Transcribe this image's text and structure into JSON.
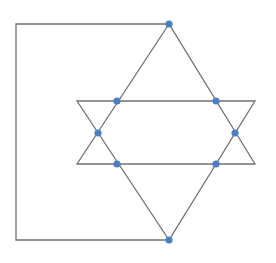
{
  "diagram": {
    "width": 276,
    "height": 263,
    "colors": {
      "line": "#707070",
      "node": "#4a7fc1",
      "background": "#ffffff"
    },
    "line_width": 1.3,
    "node_radius": 3.6,
    "bracket": {
      "points": [
        [
          169,
          24
        ],
        [
          16,
          24
        ],
        [
          16,
          240
        ],
        [
          169,
          240
        ]
      ]
    },
    "triangles": [
      {
        "name": "up-triangle",
        "points": [
          [
            169,
            24
          ],
          [
            77,
            164
          ],
          [
            255,
            164
          ]
        ]
      },
      {
        "name": "down-triangle",
        "points": [
          [
            169,
            240
          ],
          [
            77,
            101
          ],
          [
            255,
            101
          ]
        ]
      }
    ],
    "nodes": [
      {
        "name": "top-apex",
        "x": 169,
        "y": 24
      },
      {
        "name": "upper-left",
        "x": 117,
        "y": 101
      },
      {
        "name": "upper-right",
        "x": 216,
        "y": 101
      },
      {
        "name": "middle-left",
        "x": 98,
        "y": 133
      },
      {
        "name": "middle-right",
        "x": 235,
        "y": 133
      },
      {
        "name": "lower-left",
        "x": 117,
        "y": 164
      },
      {
        "name": "lower-right",
        "x": 216,
        "y": 164
      },
      {
        "name": "bottom-apex",
        "x": 169,
        "y": 240
      }
    ]
  }
}
